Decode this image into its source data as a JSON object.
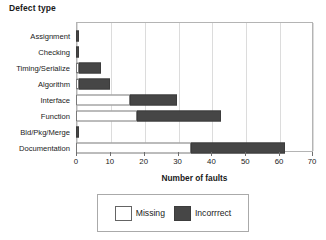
{
  "chart_data": {
    "type": "bar",
    "orientation": "horizontal",
    "stacked": true,
    "title": "Defect type",
    "xlabel": "Number of faults",
    "ylabel": "",
    "xlim": [
      0,
      70
    ],
    "xticks": [
      0,
      10,
      20,
      30,
      40,
      50,
      60,
      70
    ],
    "xtick_labels": [
      "0",
      "10",
      "20",
      "30",
      "40",
      "50",
      "60",
      "70"
    ],
    "grid": true,
    "grid_axis": "x",
    "legend_position": "below-axis",
    "categories": [
      "Assignment",
      "Checking",
      "Timing/Serialize",
      "Algorithm",
      "Interface",
      "Function",
      "Bld/Pkg/Merge",
      "Documentation"
    ],
    "series": [
      {
        "name": "Missing",
        "color": "#ffffff",
        "values": [
          0,
          0,
          1,
          1,
          16,
          18,
          0,
          34
        ]
      },
      {
        "name": "Incorrrect",
        "color": "#464646",
        "values": [
          1,
          1,
          6.5,
          9,
          14,
          25,
          1,
          28
        ]
      }
    ],
    "totals": [
      1,
      1,
      7.5,
      10,
      30,
      43,
      1,
      62
    ]
  },
  "legend": {
    "entries": [
      {
        "label": "Missing",
        "swatch": "white-square-swatch"
      },
      {
        "label": "Incorrrect",
        "swatch": "dark-square-swatch"
      }
    ]
  },
  "colors": {
    "missing_fill": "#ffffff",
    "incorrect_fill": "#464646",
    "bar_outline": "#787878",
    "gridline": "#dcdcdc",
    "plot_border": "#b4b4b4",
    "text": "#1a1a1a",
    "background": "#ffffff"
  }
}
